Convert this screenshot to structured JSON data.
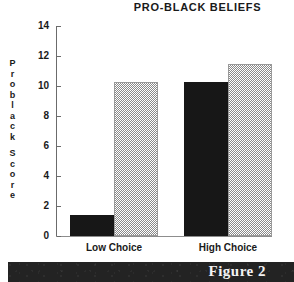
{
  "chart_data": {
    "type": "bar",
    "title": "PRO-BLACK BELIEFS",
    "xlabel": "",
    "ylabel": "Problack Score",
    "ylim": [
      0,
      14
    ],
    "yticks": [
      0,
      2,
      4,
      6,
      8,
      10,
      12,
      14
    ],
    "grid": false,
    "legend": "none",
    "categories": [
      "Low Choice",
      "High Choice"
    ],
    "series": [
      {
        "name": "black-bar",
        "fill": "solid-black",
        "values": [
          1.4,
          10.3
        ]
      },
      {
        "name": "checkered-bar",
        "fill": "checkered-gray",
        "values": [
          10.3,
          11.5
        ]
      }
    ]
  },
  "ylabel_letters": [
    "P",
    "r",
    "o",
    "b",
    "l",
    "a",
    "c",
    "k",
    " ",
    "S",
    "c",
    "o",
    "r",
    "e"
  ],
  "caption": {
    "text": "Figure 2"
  },
  "colors": {
    "bar_black": "#171717",
    "bar_check_gray": "#8a8a8a",
    "axis": "#6b6b6b",
    "text": "#1a1a1a",
    "caption_band": "#232323",
    "caption_text": "#f2f2f2",
    "background": "#ffffff"
  }
}
